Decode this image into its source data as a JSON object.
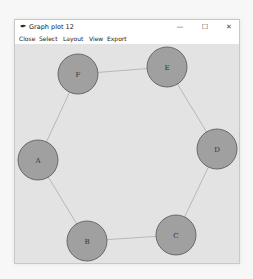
{
  "window": {
    "title": "Graph plot 12",
    "title_icon": "feather-icon",
    "controls": {
      "minimize": "—",
      "maximize": "☐",
      "close": "✕"
    }
  },
  "menu": {
    "items": [
      {
        "label": "Close",
        "x": 4
      },
      {
        "label": "Select",
        "x": 24
      },
      {
        "label": "Layout",
        "x": 48
      },
      {
        "label": "View",
        "x": 74
      },
      {
        "label": "Export",
        "x": 92
      }
    ]
  },
  "graph": {
    "node_fill": "#a0a0a0",
    "node_stroke": "#555555",
    "edge_color": "#b8b8b8",
    "node_radius": 20,
    "nodes": [
      {
        "id": "A",
        "label": "A",
        "x": 23,
        "y": 116
      },
      {
        "id": "B",
        "label": "B",
        "x": 72,
        "y": 197
      },
      {
        "id": "C",
        "label": "C",
        "x": 161,
        "y": 191
      },
      {
        "id": "D",
        "label": "D",
        "x": 202,
        "y": 105
      },
      {
        "id": "E",
        "label": "E",
        "x": 152,
        "y": 23
      },
      {
        "id": "F",
        "label": "F",
        "x": 63,
        "y": 30
      }
    ],
    "edges": [
      [
        "A",
        "B"
      ],
      [
        "B",
        "C"
      ],
      [
        "C",
        "D"
      ],
      [
        "D",
        "E"
      ],
      [
        "E",
        "F"
      ],
      [
        "F",
        "A"
      ]
    ]
  }
}
